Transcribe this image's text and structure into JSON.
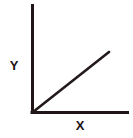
{
  "figure": {
    "title": "",
    "background_color": "#ffffff",
    "width": 133,
    "height": 138
  },
  "labels": {
    "y_axis": "Y",
    "x_axis": "X"
  },
  "colors": {
    "axis": "#201517",
    "line": "#231A1C",
    "label_text": "#1d1416",
    "background": "#ffffff"
  },
  "chart_data": {
    "type": "line",
    "title": "",
    "xlabel": "X",
    "ylabel": "Y",
    "grid": false,
    "legend": null,
    "axis_style": "two-spine L-shaped (left and bottom only, no ticks, no tick labels)",
    "xlim": [
      0,
      1
    ],
    "ylim": [
      0,
      1
    ],
    "series": [
      {
        "name": "",
        "x": [
          0,
          1
        ],
        "y": [
          0,
          1
        ],
        "description": "straight line through the origin with positive slope, drawn from the origin up and to the right"
      }
    ],
    "annotations": []
  },
  "geometry": {
    "origin": {
      "x": 32,
      "y": 113
    },
    "y_axis_top": {
      "x": 32,
      "y": 4
    },
    "x_axis_right": {
      "x": 129,
      "y": 113
    },
    "line_start": {
      "x": 33,
      "y": 112
    },
    "line_end": {
      "x": 109,
      "y": 52
    },
    "axis_stroke_width": 3,
    "line_stroke_width": 2.6
  }
}
